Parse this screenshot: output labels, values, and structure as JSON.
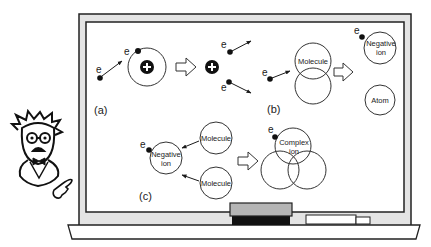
{
  "diagram": {
    "panels": {
      "a": {
        "label": "(a)",
        "electron_symbol": "e",
        "description": "Electron collides with atom, ejecting an electron leaving positive ion"
      },
      "b": {
        "label": "(b)",
        "electron_symbol": "e",
        "molecule_label": "Molecule",
        "products": {
          "negative_ion": [
            "Negative",
            "ion"
          ],
          "atom": "Atom"
        }
      },
      "c": {
        "label": "(c)",
        "electron_symbol": "e",
        "negative_ion": [
          "Negative",
          "ion"
        ],
        "molecule_top": "Molecule",
        "molecule_bottom": "Molecule",
        "complex_ion": [
          "Complex",
          "ion"
        ]
      }
    },
    "scene": {
      "board": "chalkboard",
      "presenter": "professor-cartoon",
      "tray_items": [
        "eraser",
        "chalk"
      ]
    },
    "colors": {
      "ink": "#1a1a1a",
      "board_frame": "#e4e4e4",
      "eraser_top": "#b5b5b5",
      "eraser_base": "#111111"
    }
  }
}
